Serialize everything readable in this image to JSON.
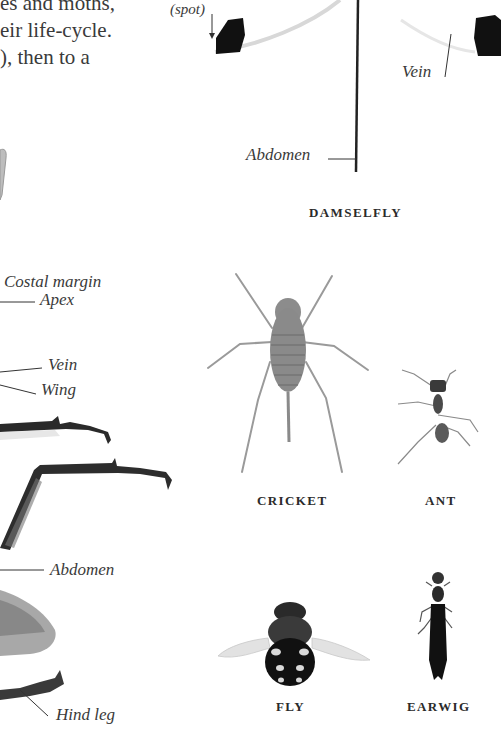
{
  "intro_text": {
    "lines": [
      "es and moths,",
      "eir life-cycle.",
      "), then to a"
    ]
  },
  "damselfly": {
    "caption": "DAMSELFLY",
    "labels": {
      "spot": "(spot)",
      "vein": "Vein",
      "abdomen": "Abdomen"
    }
  },
  "main_specimen": {
    "labels": {
      "costal_margin": "Costal margin",
      "apex": "Apex",
      "vein": "Vein",
      "wing": "Wing",
      "abdomen": "Abdomen",
      "hind_leg": "Hind leg"
    }
  },
  "specimens": [
    {
      "name": "cricket",
      "caption": "CRICKET"
    },
    {
      "name": "ant",
      "caption": "ANT"
    },
    {
      "name": "fly",
      "caption": "FLY"
    },
    {
      "name": "earwig",
      "caption": "EARWIG"
    }
  ],
  "colors": {
    "text": "#2a2a2a",
    "background": "#ffffff",
    "specimen_dark": "#111111",
    "specimen_grey": "#9a9a9a"
  }
}
